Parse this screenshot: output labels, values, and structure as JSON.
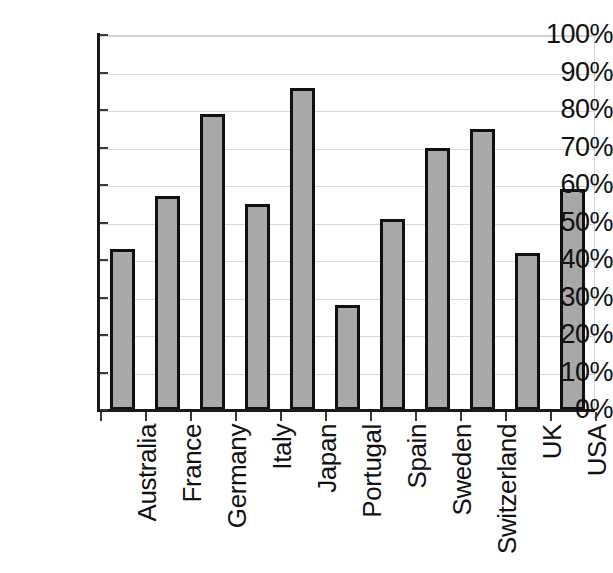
{
  "chart_data": {
    "type": "bar",
    "title": "",
    "subtitle": "",
    "xlabel": "",
    "ylabel": "",
    "ylim": [
      0,
      100
    ],
    "yunit": "%",
    "grid": true,
    "legend": false,
    "legend_position": "none",
    "bar_fill_color": "#a8a8a8",
    "bar_border_color": "#101010",
    "gridline_color": "#d9d9d9",
    "axis_color": "#1a1a1a",
    "categories": [
      "Australia",
      "France",
      "Germany",
      "Italy",
      "Japan",
      "Portugal",
      "Spain",
      "Sweden",
      "Switzerland",
      "UK",
      "USA"
    ],
    "values": [
      43,
      57,
      79,
      55,
      86,
      28,
      51,
      70,
      75,
      42,
      59
    ],
    "ytick_labels": [
      "0%",
      "10%",
      "20%",
      "30%",
      "40%",
      "50%",
      "60%",
      "70%",
      "80%",
      "90%",
      "100%"
    ],
    "ytick_values": [
      0,
      10,
      20,
      30,
      40,
      50,
      60,
      70,
      80,
      90,
      100
    ]
  }
}
